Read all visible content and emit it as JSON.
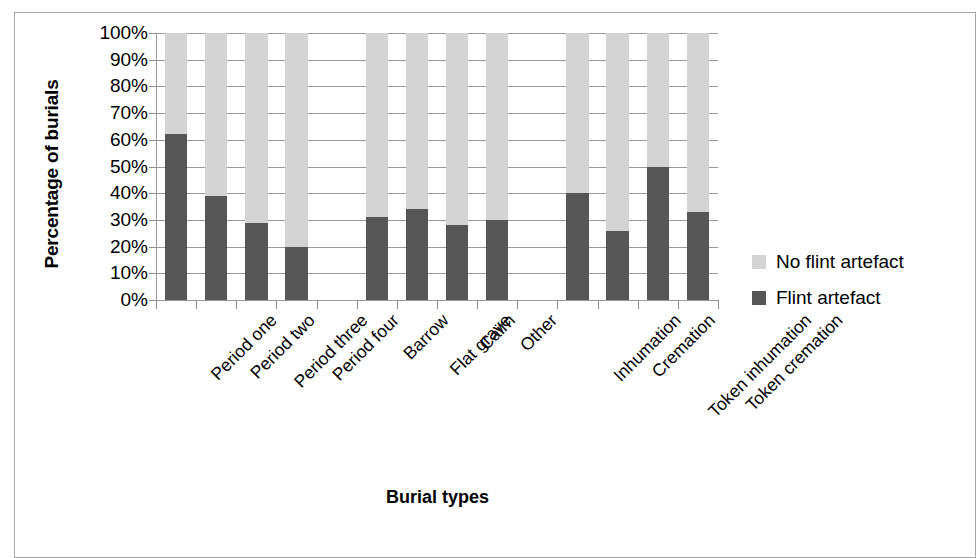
{
  "chart_data": {
    "type": "bar",
    "subtype": "stacked-100-percent",
    "title": "",
    "xlabel": "Burial types",
    "ylabel": "Percentage of burials",
    "ylim": [
      0,
      100
    ],
    "ytick_labels": [
      "100%",
      "90%",
      "80%",
      "70%",
      "60%",
      "50%",
      "40%",
      "30%",
      "20%",
      "10%",
      "0%"
    ],
    "ytick_values": [
      100,
      90,
      80,
      70,
      60,
      50,
      40,
      30,
      20,
      10,
      0
    ],
    "grid": true,
    "legend_position": "right",
    "categories": [
      "Period one",
      "Period two",
      "Period three",
      "Period four",
      "",
      "Barrow",
      "Flat grave",
      "Cairn",
      "Other",
      "",
      "Inhumation",
      "Cremation",
      "Token inhumation",
      "Token cremation"
    ],
    "series": [
      {
        "name": "Flint artefact",
        "color": "#565656",
        "values": [
          62,
          39,
          29,
          20,
          null,
          31,
          34,
          28,
          30,
          null,
          40,
          26,
          50,
          33
        ]
      },
      {
        "name": "No flint artefact",
        "color": "#d4d4d4",
        "values": [
          38,
          61,
          71,
          80,
          null,
          69,
          66,
          72,
          70,
          null,
          60,
          74,
          50,
          67
        ]
      }
    ],
    "legend": [
      {
        "label": "No flint artefact",
        "color": "#d4d4d4"
      },
      {
        "label": "Flint artefact",
        "color": "#565656"
      }
    ]
  }
}
